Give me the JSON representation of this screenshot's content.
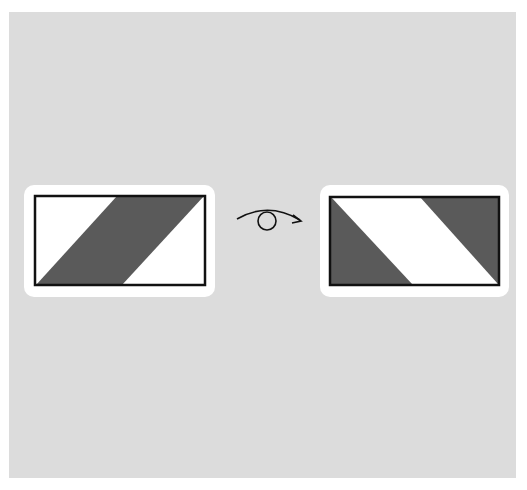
{
  "diagram": {
    "background_color": "#dcdcdc",
    "fill_dark": "#5a5a5a",
    "fill_light": "#ffffff",
    "stroke": "#111111",
    "left_card": {
      "label": "",
      "pattern": "dark diagonal band from bottom-left to top-right"
    },
    "arrow": {
      "icon": "rotate-flip-arrow-icon"
    },
    "right_card": {
      "label": "",
      "pattern": "dark triangles at left and top-right, white diagonal band"
    }
  }
}
